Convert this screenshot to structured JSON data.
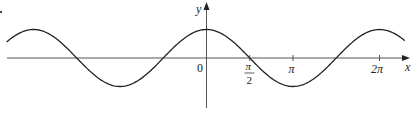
{
  "chart_data": {
    "type": "line",
    "title": "",
    "function": "y = cos(x)",
    "xlabel": "x",
    "ylabel": "y",
    "origin_label": "0",
    "x_ticks": [
      {
        "value": 1.5708,
        "label": "π/2",
        "num": "π",
        "den": "2"
      },
      {
        "value": 3.1416,
        "label": "π"
      },
      {
        "value": 6.2832,
        "label": "2π"
      }
    ],
    "xlim": [
      -7.26,
      7.2
    ],
    "ylim": [
      -1.0,
      1.0
    ],
    "grid": false,
    "legend": null,
    "series": [
      {
        "name": "cos x",
        "color": "#222222",
        "x": [
          -7.26,
          -6.2832,
          -4.7124,
          -3.1416,
          -1.5708,
          0,
          1.5708,
          3.1416,
          4.7124,
          6.2832,
          7.2
        ],
        "values": [
          0.56,
          1,
          0,
          -1,
          0,
          1,
          0,
          -1,
          0,
          1,
          0.61
        ]
      }
    ],
    "key_points": {
      "maxima": [
        [
          -6.2832,
          1
        ],
        [
          0,
          1
        ],
        [
          6.2832,
          1
        ]
      ],
      "minima": [
        [
          -3.1416,
          -1
        ],
        [
          3.1416,
          -1
        ]
      ],
      "zeros": [
        -4.7124,
        -1.5708,
        1.5708,
        4.7124
      ]
    }
  }
}
